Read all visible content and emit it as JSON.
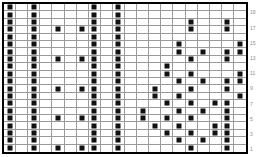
{
  "chart_data": {
    "type": "heatmap",
    "title": "",
    "xlabel": "",
    "ylabel": "",
    "rows": 20,
    "columns": 20,
    "grid_on": true,
    "legend_position": "none",
    "filled_color": "#111111",
    "empty_color": "#ffffff",
    "gridline_color": "#9a9a9a",
    "border_color": "#000000",
    "row_label_color": "#8b8b8b",
    "row_labels_side": "right",
    "row_labels": [
      "19",
      "17",
      "15",
      "13",
      "11",
      "9",
      "7",
      "5",
      "3",
      "1"
    ],
    "row_label_rows": [
      1,
      3,
      5,
      7,
      9,
      11,
      13,
      15,
      17,
      19
    ],
    "matrix": [
      [
        1,
        0,
        1,
        0,
        0,
        0,
        0,
        1,
        0,
        1,
        0,
        0,
        0,
        0,
        0,
        0,
        0,
        0,
        0,
        0
      ],
      [
        1,
        0,
        1,
        0,
        0,
        0,
        0,
        1,
        0,
        1,
        0,
        0,
        0,
        0,
        0,
        0,
        0,
        0,
        0,
        0
      ],
      [
        1,
        0,
        1,
        0,
        0,
        0,
        0,
        1,
        0,
        1,
        0,
        0,
        0,
        0,
        0,
        1,
        0,
        0,
        1,
        0
      ],
      [
        1,
        0,
        1,
        0,
        1,
        0,
        1,
        1,
        0,
        1,
        0,
        0,
        0,
        0,
        0,
        1,
        0,
        0,
        1,
        0
      ],
      [
        1,
        0,
        1,
        0,
        0,
        0,
        0,
        1,
        0,
        1,
        0,
        0,
        0,
        0,
        0,
        0,
        0,
        0,
        0,
        0
      ],
      [
        1,
        0,
        1,
        0,
        0,
        0,
        0,
        1,
        0,
        1,
        0,
        0,
        0,
        0,
        1,
        0,
        0,
        0,
        0,
        1
      ],
      [
        1,
        0,
        1,
        0,
        0,
        0,
        0,
        1,
        0,
        1,
        0,
        0,
        0,
        0,
        1,
        0,
        1,
        0,
        1,
        1
      ],
      [
        1,
        0,
        1,
        0,
        1,
        0,
        1,
        1,
        0,
        1,
        0,
        0,
        0,
        0,
        0,
        1,
        0,
        0,
        1,
        0
      ],
      [
        1,
        0,
        1,
        0,
        0,
        0,
        0,
        1,
        0,
        1,
        0,
        0,
        0,
        1,
        0,
        0,
        0,
        0,
        0,
        0
      ],
      [
        1,
        0,
        1,
        0,
        0,
        0,
        0,
        1,
        0,
        1,
        0,
        0,
        0,
        1,
        0,
        1,
        0,
        0,
        0,
        1
      ],
      [
        1,
        0,
        1,
        0,
        0,
        0,
        0,
        1,
        0,
        1,
        0,
        0,
        0,
        0,
        1,
        0,
        1,
        0,
        1,
        1
      ],
      [
        1,
        0,
        1,
        0,
        1,
        0,
        1,
        1,
        0,
        1,
        0,
        0,
        1,
        0,
        0,
        1,
        0,
        0,
        1,
        0
      ],
      [
        1,
        0,
        1,
        0,
        0,
        0,
        0,
        1,
        0,
        1,
        0,
        0,
        1,
        0,
        1,
        0,
        0,
        0,
        0,
        1
      ],
      [
        1,
        0,
        1,
        0,
        0,
        0,
        0,
        1,
        0,
        1,
        0,
        0,
        0,
        1,
        0,
        1,
        0,
        1,
        1,
        0
      ],
      [
        1,
        0,
        1,
        0,
        0,
        0,
        0,
        1,
        0,
        1,
        0,
        1,
        0,
        0,
        1,
        0,
        1,
        0,
        1,
        0
      ],
      [
        1,
        0,
        1,
        0,
        1,
        0,
        1,
        1,
        0,
        1,
        0,
        1,
        0,
        1,
        0,
        1,
        0,
        0,
        1,
        0
      ],
      [
        1,
        0,
        1,
        0,
        0,
        0,
        0,
        1,
        0,
        1,
        0,
        0,
        1,
        0,
        1,
        0,
        0,
        1,
        1,
        0
      ],
      [
        1,
        0,
        1,
        0,
        0,
        0,
        0,
        1,
        0,
        1,
        0,
        0,
        0,
        1,
        0,
        1,
        0,
        1,
        1,
        0
      ],
      [
        1,
        0,
        1,
        0,
        0,
        0,
        0,
        1,
        0,
        1,
        0,
        0,
        0,
        0,
        1,
        0,
        1,
        0,
        1,
        0
      ],
      [
        1,
        0,
        1,
        0,
        1,
        0,
        1,
        1,
        0,
        1,
        0,
        0,
        0,
        0,
        0,
        1,
        0,
        0,
        1,
        0
      ]
    ]
  }
}
